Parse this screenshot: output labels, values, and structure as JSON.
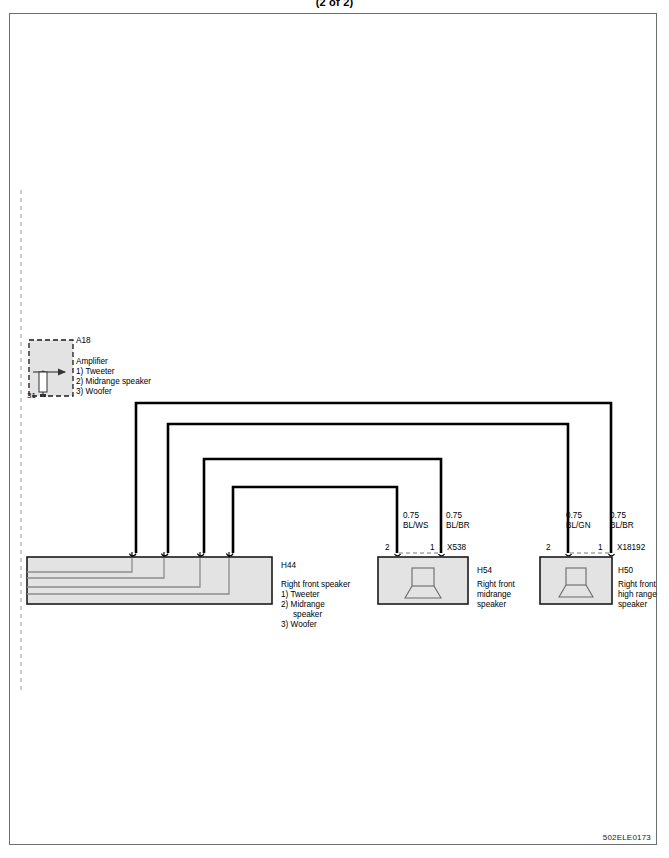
{
  "sheet": {
    "title": "(2 of 2)",
    "footer_code": "502ELE0173"
  },
  "components": {
    "amplifier": {
      "id": "A18",
      "name": "Amplifier",
      "pin_legend": [
        "1) Tweeter",
        "2) Midrange speaker",
        "3) Woofer"
      ],
      "ground_label": "31"
    },
    "right_front_speaker": {
      "id": "H44",
      "name": "Right front speaker",
      "pin_legend": [
        "1) Tweeter",
        "2) Midrange",
        "speaker",
        "3) Woofer"
      ]
    },
    "right_front_midrange_speaker": {
      "id": "H54",
      "name_lines": [
        "Right front",
        "midrange",
        "speaker"
      ],
      "connector": "X538",
      "pins": [
        "2",
        "1"
      ],
      "icon": "speaker-icon"
    },
    "right_front_high_range_speaker": {
      "id": "H50",
      "name_lines": [
        "Right front",
        "high range",
        "speaker"
      ],
      "connector": "X18192",
      "pins": [
        "2",
        "1"
      ],
      "icon": "speaker-icon"
    }
  },
  "wires": [
    {
      "gauge": "0.75",
      "color_code": "BL/WS",
      "from": "H44",
      "to": "X538 pin 2"
    },
    {
      "gauge": "0.75",
      "color_code": "BL/BR",
      "from": "H44",
      "to": "X538 pin 1"
    },
    {
      "gauge": "0.75",
      "color_code": "BL/GN",
      "from": "H44",
      "to": "X18192 pin 2"
    },
    {
      "gauge": "0.75",
      "color_code": "BL/BR",
      "from": "H44",
      "to": "X18192 pin 1"
    }
  ],
  "colors": {
    "line": "#000000",
    "block_fill": "#e3e3e3",
    "block_stroke": "#1a1a1a",
    "frame_stroke": "#6f6f6f",
    "inner_trace": "#8c8c8c",
    "dashed_guide": "#9a9a9a"
  }
}
